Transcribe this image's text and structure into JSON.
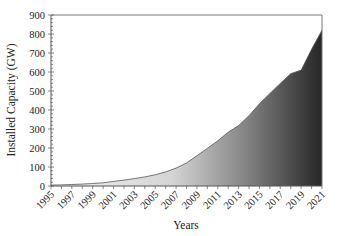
{
  "chart_data": {
    "type": "area",
    "title": "",
    "xlabel": "Years",
    "ylabel": "Installed Capacity (GW)",
    "ylim": [
      0,
      900
    ],
    "xlim": [
      1995,
      2021
    ],
    "grid": false,
    "legend": null,
    "yticks": [
      0,
      100,
      200,
      300,
      400,
      500,
      600,
      700,
      800,
      900
    ],
    "xticks": [
      1995,
      1997,
      1999,
      2001,
      2003,
      2005,
      2007,
      2009,
      2011,
      2013,
      2015,
      2017,
      2019,
      2021
    ],
    "fill": "gradient light gray to near-black (left to right)",
    "x": [
      1995,
      1996,
      1997,
      1998,
      1999,
      2000,
      2001,
      2002,
      2003,
      2004,
      2005,
      2006,
      2007,
      2008,
      2009,
      2010,
      2011,
      2012,
      2013,
      2014,
      2015,
      2016,
      2017,
      2018,
      2019,
      2020,
      2021
    ],
    "values": [
      5,
      6,
      8,
      10,
      13,
      17,
      24,
      31,
      39,
      48,
      59,
      74,
      94,
      121,
      159,
      198,
      238,
      283,
      318,
      370,
      433,
      487,
      540,
      591,
      610,
      720,
      820
    ]
  }
}
